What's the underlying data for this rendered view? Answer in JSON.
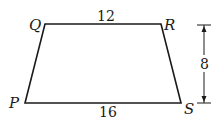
{
  "diagram": {
    "vertices": {
      "Q": {
        "label": "Q",
        "x": 45,
        "y": 24
      },
      "R": {
        "label": "R",
        "x": 161,
        "y": 24
      },
      "S": {
        "label": "S",
        "x": 181,
        "y": 103
      },
      "P": {
        "label": "P",
        "x": 25,
        "y": 103
      }
    },
    "measurements": {
      "top_base": "12",
      "bottom_base": "16",
      "height": "8"
    },
    "colors": {
      "stroke": "#1a1a1a",
      "background": "#ffffff"
    }
  }
}
